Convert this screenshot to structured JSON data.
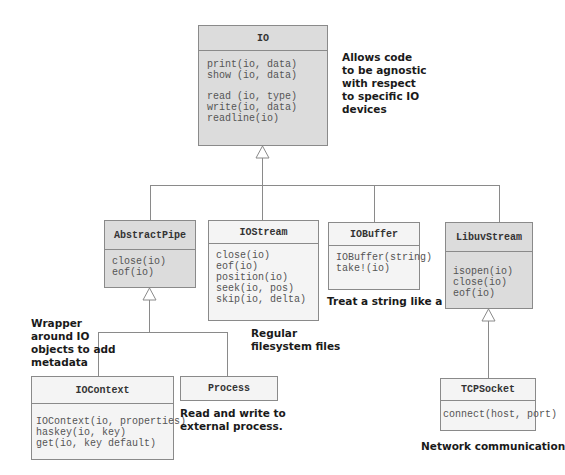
{
  "diagram": {
    "type": "uml-class-hierarchy",
    "classes": {
      "io": {
        "name": "IO",
        "methods_group1": "print(io, data)\nshow (io, data)",
        "methods_group2": "read (io, type)\nwrite(io, data)\nreadline(io)",
        "shaded": true
      },
      "abstractpipe": {
        "name": "AbstractPipe",
        "methods": "close(io)\neof(io)",
        "shaded": true
      },
      "iostream": {
        "name": "IOStream",
        "methods": "close(io)\neof(io)\nposition(io)\nseek(io, pos)\nskip(io, delta)",
        "shaded": false
      },
      "iobuffer": {
        "name": "IOBuffer",
        "methods": "IOBuffer(string)\ntake!(io)",
        "shaded": false
      },
      "libuvstream": {
        "name": "LibuvStream",
        "methods": "isopen(io)\nclose(io)\neof(io)",
        "shaded": true
      },
      "iocontext": {
        "name": "IOContext",
        "methods": "IOContext(io, properties)\nhaskey(io, key)\nget(io, key default)",
        "shaded": false
      },
      "process": {
        "name": "Process",
        "shaded": false
      },
      "tcpsocket": {
        "name": "TCPSocket",
        "methods": "connect(host, port)",
        "shaded": false
      }
    },
    "notes": {
      "io": "Allows code\nto be agnostic\nwith respect\nto specific IO\ndevices",
      "iostream": "Regular\nfilesystem files",
      "iobuffer": "Treat a string like a file.",
      "abstractpipe": "Wrapper\naround IO\nobjects to add\nmetadata",
      "process": "Read and write to\nexternal process.",
      "tcpsocket": "Network communication"
    },
    "inheritance": [
      {
        "child": "AbstractPipe",
        "parent": "IO"
      },
      {
        "child": "IOStream",
        "parent": "IO"
      },
      {
        "child": "IOBuffer",
        "parent": "IO"
      },
      {
        "child": "LibuvStream",
        "parent": "IO"
      },
      {
        "child": "IOContext",
        "parent": "AbstractPipe"
      },
      {
        "child": "Process",
        "parent": "AbstractPipe"
      },
      {
        "child": "TCPSocket",
        "parent": "LibuvStream"
      }
    ],
    "colors": {
      "shaded_fill": "#dcdcdc",
      "plain_fill": "#f4f4f4",
      "border": "#8a8a8a",
      "line": "#8a8a8a"
    }
  }
}
